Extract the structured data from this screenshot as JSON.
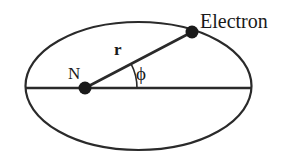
{
  "figure": {
    "name": "atomic-orbit-diagram",
    "background_color": "#ffffff",
    "stroke_color": "#2a2a2a",
    "labels": {
      "electron": "Electron",
      "nucleus": "N",
      "radius": "r",
      "angle": "ϕ"
    },
    "geometry": {
      "ellipse": {
        "cx": 138.5,
        "cy": 86,
        "rx": 113,
        "ry": 64
      },
      "major_axis_line": {
        "x1": 25.5,
        "y1": 88,
        "x2": 251.5,
        "y2": 88
      },
      "nucleus_point": {
        "x": 85,
        "y": 88,
        "r": 6.5
      },
      "electron_point": {
        "x": 192,
        "y": 32,
        "r": 6.5
      },
      "radius_line": {
        "x1": 85,
        "y1": 88,
        "x2": 192,
        "y2": 32
      },
      "angle_arc_radius": 52,
      "angle_degrees": 27.6
    },
    "label_positions": {
      "electron": {
        "x": 200,
        "y": 28
      },
      "nucleus": {
        "x": 68,
        "y": 79
      },
      "radius": {
        "x": 114,
        "y": 55
      },
      "angle": {
        "x": 136,
        "y": 80
      }
    }
  }
}
